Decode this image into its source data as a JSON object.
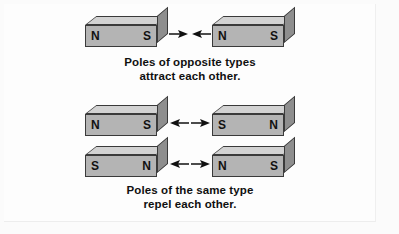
{
  "figure": {
    "background_color": "#fbfbfb",
    "magnet_colors": {
      "top_face": "#d2d2d2",
      "front_face": "#b4b4b4",
      "side_face": "#8e8e8e",
      "outline": "#3a3a3a",
      "label_text": "#111111"
    }
  },
  "groups": [
    {
      "id": "attract",
      "rows": [
        {
          "id": "attract-row",
          "left_magnet": {
            "left_pole": "N",
            "right_pole": "S"
          },
          "right_magnet": {
            "left_pole": "N",
            "right_pole": "S"
          },
          "arrows": {
            "direction": "inward",
            "left_arrow_icon": "arrow-right-icon",
            "right_arrow_icon": "arrow-left-icon"
          }
        }
      ],
      "caption": {
        "line1": "Poles of opposite types",
        "line2": "attract each other."
      }
    },
    {
      "id": "repel",
      "rows": [
        {
          "id": "repel-row-1",
          "left_magnet": {
            "left_pole": "N",
            "right_pole": "S"
          },
          "right_magnet": {
            "left_pole": "S",
            "right_pole": "N"
          },
          "arrows": {
            "direction": "outward",
            "left_arrow_icon": "arrow-left-icon",
            "right_arrow_icon": "arrow-right-icon"
          }
        },
        {
          "id": "repel-row-2",
          "left_magnet": {
            "left_pole": "S",
            "right_pole": "N"
          },
          "right_magnet": {
            "left_pole": "N",
            "right_pole": "S"
          },
          "arrows": {
            "direction": "outward",
            "left_arrow_icon": "arrow-left-icon",
            "right_arrow_icon": "arrow-right-icon"
          }
        }
      ],
      "caption": {
        "line1": "Poles of the same type",
        "line2": "repel each other."
      }
    }
  ]
}
